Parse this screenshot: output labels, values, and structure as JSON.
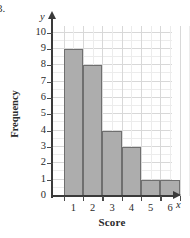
{
  "problem": {
    "number_label": "3."
  },
  "axes": {
    "y_variable_glyph": "y",
    "x_variable_glyph": "x",
    "y_title": "Frequency",
    "x_title": "Score",
    "y_ticks": [
      "0",
      "1",
      "2",
      "3",
      "4",
      "5",
      "6",
      "7",
      "8",
      "9",
      "10"
    ],
    "x_ticks": [
      "1",
      "2",
      "3",
      "4",
      "5",
      "6"
    ]
  },
  "colors": {
    "bar_fill": "#adadad",
    "bar_stroke": "#6f6f6f",
    "gridline_major": "#d8d8d8",
    "gridline_minor": "#ececec",
    "axis": "#3a3a3a",
    "background": "#ffffff",
    "text": "#2b2b2b"
  },
  "chart_data": {
    "type": "bar",
    "title": "",
    "subtitle": "",
    "xlabel": "Score",
    "ylabel": "Frequency",
    "categories": [
      "1",
      "2",
      "3",
      "4",
      "5",
      "6"
    ],
    "values": [
      9,
      8,
      4,
      3,
      1,
      1
    ],
    "series": [
      {
        "name": "Frequency",
        "values": [
          9,
          8,
          4,
          3,
          1,
          1
        ]
      }
    ],
    "ylim": [
      0,
      10
    ],
    "xlim": [
      0.5,
      6.5
    ],
    "y_ticks": [
      0,
      1,
      2,
      3,
      4,
      5,
      6,
      7,
      8,
      9,
      10
    ],
    "x_ticks": [
      1,
      2,
      3,
      4,
      5,
      6
    ],
    "grid": true,
    "legend": "none",
    "annotations": []
  }
}
